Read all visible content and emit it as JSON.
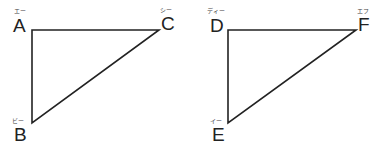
{
  "diagrams": [
    {
      "name": "triangle-ABC",
      "vertices": [
        {
          "label": "A",
          "reading": "エー",
          "x": 32,
          "y": 30
        },
        {
          "label": "B",
          "reading": "ビー",
          "x": 32,
          "y": 123
        },
        {
          "label": "C",
          "reading": "シー",
          "x": 159,
          "y": 30
        }
      ]
    },
    {
      "name": "triangle-DEF",
      "vertices": [
        {
          "label": "D",
          "reading": "ディー",
          "x": 228,
          "y": 30
        },
        {
          "label": "E",
          "reading": "イー",
          "x": 228,
          "y": 123
        },
        {
          "label": "F",
          "reading": "エフ",
          "x": 356,
          "y": 30
        }
      ]
    }
  ],
  "colors": {
    "stroke": "#222222",
    "background": "#ffffff"
  }
}
